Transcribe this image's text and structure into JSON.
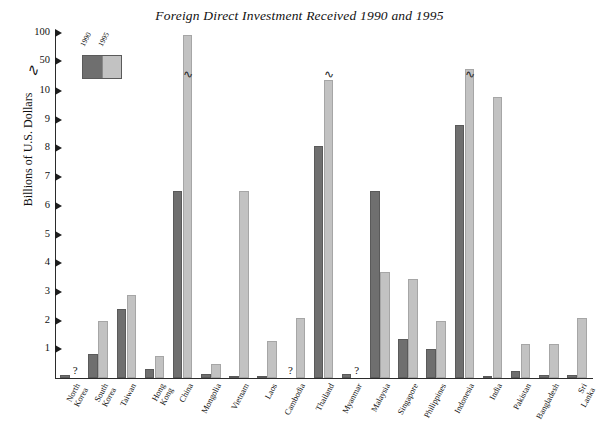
{
  "chart_data": {
    "type": "bar",
    "title": "Foreign Direct Investment Received 1990 and 1995",
    "xlabel": "",
    "ylabel": "Billions of U.S. Dollars",
    "ylim": [
      0,
      100
    ],
    "grid": false,
    "legend_position": "top-left",
    "axis_break": {
      "between": [
        10,
        50
      ],
      "symbol": "∿"
    },
    "ytick_labels": [
      "1",
      "2",
      "3",
      "4",
      "5",
      "6",
      "7",
      "8",
      "9",
      "10",
      "50",
      "100"
    ],
    "categories": [
      "North Korea",
      "South Korea",
      "Taiwan",
      "Hong Kong",
      "China",
      "Mongolia",
      "Vietnam",
      "Laos",
      "Cambodia",
      "Thailand",
      "Myanmar",
      "Malaysia",
      "Singapore",
      "Philippines",
      "Indonesia",
      "India",
      "Pakistan",
      "Bangladesh",
      "Sri Lanka"
    ],
    "series": [
      {
        "name": "1990",
        "color": "#6f6f6f",
        "values": [
          0.12,
          0.85,
          2.4,
          0.3,
          6.5,
          0.15,
          0.05,
          0.05,
          null,
          8.1,
          0.15,
          6.5,
          1.35,
          1.0,
          8.8,
          0.05,
          0.25,
          0.1,
          0.1
        ]
      },
      {
        "name": "1995",
        "color": "#c2c2c2",
        "values": [
          null,
          2.0,
          2.9,
          0.75,
          97.0,
          0.5,
          6.5,
          1.3,
          2.1,
          25.0,
          null,
          3.7,
          3.45,
          2.0,
          40.0,
          9.8,
          1.2,
          1.2,
          2.1
        ]
      }
    ],
    "missing_marker": "?",
    "missing_points": [
      {
        "category": "North Korea",
        "series": "1995"
      },
      {
        "category": "Cambodia",
        "series": "1990"
      },
      {
        "category": "Myanmar",
        "series": "1995"
      }
    ]
  },
  "legend": {
    "items": [
      {
        "label": "1990",
        "color": "#6f6f6f"
      },
      {
        "label": "1995",
        "color": "#c2c2c2"
      }
    ]
  }
}
